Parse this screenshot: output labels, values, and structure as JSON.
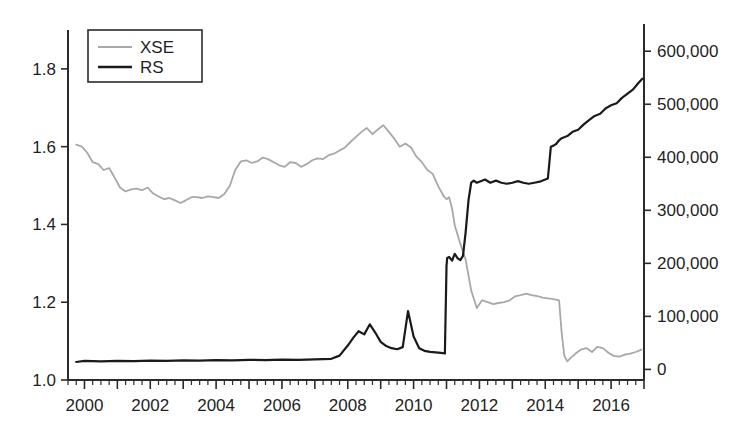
{
  "chart_data": {
    "type": "line",
    "title": "",
    "subtitle": "",
    "xlabel": "",
    "ylabel": "",
    "ylabel_right": "",
    "grid": false,
    "legend_position": "top-left",
    "xlim": [
      1999.5,
      2017.0
    ],
    "ylim_left": [
      1.0,
      1.9
    ],
    "ylim_right": [
      -20000,
      640000
    ],
    "x_ticks": [
      2000,
      2002,
      2004,
      2006,
      2008,
      2010,
      2012,
      2014,
      2016
    ],
    "x_tick_labels": [
      "2000",
      "2002",
      "2004",
      "2006",
      "2008",
      "2010",
      "2012",
      "2014",
      "2016"
    ],
    "x_minor_tick_step": 0.25,
    "y_ticks_left": [
      1.0,
      1.2,
      1.4,
      1.6,
      1.8
    ],
    "y_tick_labels_left": [
      "1.0",
      "1.2",
      "1.4",
      "1.6",
      "1.8"
    ],
    "y_ticks_right": [
      0,
      100000,
      200000,
      300000,
      400000,
      500000,
      600000
    ],
    "y_tick_labels_right": [
      "0",
      "100,000",
      "200,000",
      "300,000",
      "400,000",
      "500,000",
      "600,000"
    ],
    "series": [
      {
        "name": "XSE",
        "axis": "left",
        "color": "#a8a8a8",
        "width": 1.8,
        "x": [
          1999.75,
          1999.92,
          2000.08,
          2000.25,
          2000.42,
          2000.58,
          2000.75,
          2000.92,
          2001.08,
          2001.25,
          2001.42,
          2001.58,
          2001.75,
          2001.92,
          2002.08,
          2002.25,
          2002.42,
          2002.58,
          2002.75,
          2002.92,
          2003.08,
          2003.25,
          2003.42,
          2003.58,
          2003.75,
          2003.92,
          2004.08,
          2004.25,
          2004.42,
          2004.58,
          2004.75,
          2004.92,
          2005.08,
          2005.25,
          2005.42,
          2005.58,
          2005.75,
          2005.92,
          2006.08,
          2006.25,
          2006.42,
          2006.58,
          2006.75,
          2006.92,
          2007.08,
          2007.25,
          2007.42,
          2007.58,
          2007.75,
          2007.92,
          2008.08,
          2008.25,
          2008.42,
          2008.58,
          2008.75,
          2008.92,
          2009.08,
          2009.25,
          2009.42,
          2009.58,
          2009.75,
          2009.92,
          2010.08,
          2010.25,
          2010.42,
          2010.58,
          2010.75,
          2010.92,
          2011.0,
          2011.08,
          2011.17,
          2011.25,
          2011.42,
          2011.58,
          2011.75,
          2011.92,
          2012.08,
          2012.25,
          2012.42,
          2012.58,
          2012.75,
          2012.92,
          2013.08,
          2013.25,
          2013.42,
          2013.58,
          2013.75,
          2013.92,
          2014.08,
          2014.25,
          2014.42,
          2014.5,
          2014.58,
          2014.67,
          2014.75,
          2014.92,
          2015.08,
          2015.25,
          2015.42,
          2015.58,
          2015.75,
          2015.92,
          2016.08,
          2016.25,
          2016.42,
          2016.58,
          2016.75,
          2016.92
        ],
        "y": [
          1.605,
          1.6,
          1.585,
          1.56,
          1.555,
          1.54,
          1.545,
          1.52,
          1.495,
          1.485,
          1.49,
          1.492,
          1.488,
          1.495,
          1.48,
          1.472,
          1.465,
          1.468,
          1.462,
          1.455,
          1.462,
          1.47,
          1.47,
          1.468,
          1.472,
          1.47,
          1.468,
          1.478,
          1.5,
          1.54,
          1.562,
          1.565,
          1.558,
          1.562,
          1.572,
          1.568,
          1.56,
          1.552,
          1.548,
          1.56,
          1.558,
          1.548,
          1.555,
          1.565,
          1.57,
          1.568,
          1.578,
          1.582,
          1.59,
          1.598,
          1.612,
          1.625,
          1.638,
          1.648,
          1.632,
          1.645,
          1.655,
          1.638,
          1.62,
          1.6,
          1.608,
          1.598,
          1.575,
          1.56,
          1.54,
          1.53,
          1.498,
          1.472,
          1.465,
          1.47,
          1.44,
          1.398,
          1.35,
          1.31,
          1.23,
          1.185,
          1.205,
          1.2,
          1.195,
          1.198,
          1.2,
          1.205,
          1.215,
          1.218,
          1.222,
          1.218,
          1.216,
          1.212,
          1.21,
          1.208,
          1.205,
          1.12,
          1.062,
          1.048,
          1.055,
          1.068,
          1.078,
          1.082,
          1.072,
          1.085,
          1.082,
          1.07,
          1.062,
          1.06,
          1.065,
          1.068,
          1.072,
          1.078
        ]
      },
      {
        "name": "RS",
        "axis": "right",
        "color": "#1a1a1a",
        "width": 2.2,
        "x": [
          1999.75,
          2000.0,
          2000.5,
          2001.0,
          2001.5,
          2002.0,
          2002.5,
          2003.0,
          2003.5,
          2004.0,
          2004.5,
          2005.0,
          2005.5,
          2006.0,
          2006.5,
          2007.0,
          2007.5,
          2007.75,
          2008.0,
          2008.17,
          2008.33,
          2008.5,
          2008.67,
          2008.83,
          2009.0,
          2009.17,
          2009.33,
          2009.5,
          2009.67,
          2009.83,
          2010.0,
          2010.17,
          2010.33,
          2010.5,
          2010.67,
          2010.83,
          2010.95,
          2011.0,
          2011.02,
          2011.08,
          2011.17,
          2011.25,
          2011.33,
          2011.42,
          2011.5,
          2011.58,
          2011.67,
          2011.75,
          2011.83,
          2011.92,
          2012.0,
          2012.17,
          2012.33,
          2012.5,
          2012.67,
          2012.83,
          2013.0,
          2013.17,
          2013.33,
          2013.5,
          2013.67,
          2013.83,
          2014.0,
          2014.08,
          2014.17,
          2014.25,
          2014.33,
          2014.42,
          2014.5,
          2014.67,
          2014.83,
          2015.0,
          2015.17,
          2015.33,
          2015.5,
          2015.67,
          2015.83,
          2016.0,
          2016.17,
          2016.33,
          2016.5,
          2016.67,
          2016.83,
          2016.95
        ],
        "y": [
          14000,
          16000,
          15000,
          16000,
          15500,
          16500,
          16000,
          17000,
          16500,
          17500,
          17000,
          18000,
          17500,
          18500,
          18000,
          19000,
          20000,
          26000,
          45000,
          60000,
          72000,
          66000,
          85000,
          70000,
          52000,
          44000,
          40000,
          38000,
          42000,
          110000,
          62000,
          40000,
          35000,
          33000,
          32000,
          31000,
          30000,
          195000,
          210000,
          212000,
          205000,
          218000,
          210000,
          206000,
          214000,
          258000,
          320000,
          352000,
          356000,
          352000,
          354000,
          358000,
          352000,
          356000,
          352000,
          350000,
          352000,
          355000,
          352000,
          350000,
          352000,
          354000,
          358000,
          360000,
          420000,
          422000,
          425000,
          432000,
          436000,
          440000,
          448000,
          452000,
          462000,
          470000,
          478000,
          482000,
          492000,
          498000,
          502000,
          512000,
          520000,
          528000,
          540000,
          548000
        ]
      }
    ],
    "legend": [
      {
        "label": "XSE",
        "color": "#a8a8a8",
        "width": 1.8
      },
      {
        "label": "RS",
        "color": "#1a1a1a",
        "width": 2.6
      }
    ]
  },
  "axes": {
    "left_axis_name": "left-value-axis",
    "right_axis_name": "right-value-axis",
    "bottom_axis_name": "year-axis"
  }
}
